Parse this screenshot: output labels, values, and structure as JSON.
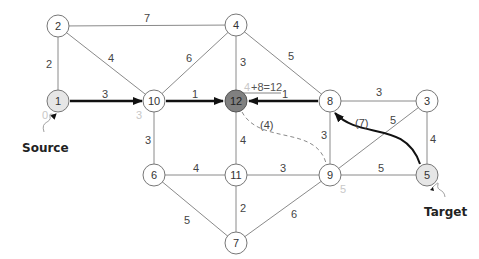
{
  "diagram": {
    "nodes": [
      {
        "id": "1",
        "x": 58,
        "y": 101,
        "style": "shaded",
        "dist": "0"
      },
      {
        "id": "2",
        "x": 58,
        "y": 26,
        "style": "plain"
      },
      {
        "id": "4",
        "x": 236,
        "y": 25,
        "style": "plain"
      },
      {
        "id": "10",
        "x": 154,
        "y": 101,
        "style": "plain",
        "dist": "3"
      },
      {
        "id": "12",
        "x": 236,
        "y": 101,
        "style": "dark"
      },
      {
        "id": "8",
        "x": 330,
        "y": 101,
        "style": "plain"
      },
      {
        "id": "3",
        "x": 427,
        "y": 101,
        "style": "plain"
      },
      {
        "id": "6",
        "x": 154,
        "y": 175,
        "style": "plain"
      },
      {
        "id": "11",
        "x": 236,
        "y": 175,
        "style": "plain"
      },
      {
        "id": "9",
        "x": 330,
        "y": 175,
        "style": "plain",
        "dist": "5"
      },
      {
        "id": "5",
        "x": 427,
        "y": 175,
        "style": "shaded"
      },
      {
        "id": "7",
        "x": 236,
        "y": 243,
        "style": "plain"
      }
    ],
    "edges": [
      {
        "from": "2",
        "to": "4",
        "weight": "7"
      },
      {
        "from": "2",
        "to": "1",
        "weight": "2"
      },
      {
        "from": "2",
        "to": "10",
        "weight": "4"
      },
      {
        "from": "1",
        "to": "10",
        "weight": "3",
        "highlight": true
      },
      {
        "from": "10",
        "to": "4",
        "weight": "6"
      },
      {
        "from": "10",
        "to": "12",
        "weight": "1",
        "highlight": true
      },
      {
        "from": "4",
        "to": "12",
        "weight": "3"
      },
      {
        "from": "4",
        "to": "8",
        "weight": "5"
      },
      {
        "from": "8",
        "to": "12",
        "weight": "1",
        "highlight": true
      },
      {
        "from": "8",
        "to": "3",
        "weight": "3"
      },
      {
        "from": "8",
        "to": "9",
        "weight": "3"
      },
      {
        "from": "9",
        "to": "3",
        "weight": "5"
      },
      {
        "from": "3",
        "to": "5",
        "weight": "4"
      },
      {
        "from": "10",
        "to": "6",
        "weight": "3"
      },
      {
        "from": "12",
        "to": "11",
        "weight": "4"
      },
      {
        "from": "6",
        "to": "11",
        "weight": "4"
      },
      {
        "from": "11",
        "to": "9",
        "weight": "3"
      },
      {
        "from": "9",
        "to": "5",
        "weight": "5"
      },
      {
        "from": "6",
        "to": "7",
        "weight": "5"
      },
      {
        "from": "11",
        "to": "7",
        "weight": "2"
      },
      {
        "from": "9",
        "to": "7",
        "weight": "6"
      }
    ],
    "shortcut_edges": [
      {
        "from": "5",
        "to": "8",
        "weight": "(7)",
        "style": "solid-bold"
      },
      {
        "from": "12",
        "to": "9",
        "weight": "(4)",
        "style": "dashed"
      }
    ],
    "annotation": {
      "faded": "4",
      "text": "+8=12"
    },
    "callouts": {
      "source": "Source",
      "target": "Target"
    }
  }
}
